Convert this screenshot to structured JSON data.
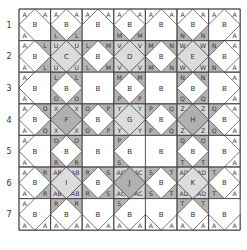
{
  "grid": {
    "x0": 19,
    "y0": 9,
    "cell": 31.6,
    "rows": 7,
    "cols": 7,
    "row_labels": [
      "1",
      "2",
      "3",
      "4",
      "5",
      "6",
      "7"
    ],
    "colors": {
      "line": "#555555",
      "border": "#444444",
      "corner_dark": "#b4b4b4",
      "corner_light": "#d6d6d6",
      "center_light": "#dcdcdc",
      "center_dark": "#b0b0b0",
      "white": "#ffffff"
    },
    "cells": [
      [
        {
          "c": "B",
          "tl": "A",
          "tr": "A",
          "bl": "A",
          "br": ""
        },
        {
          "c": "B",
          "tl": "A",
          "tr": "A",
          "bl": "L",
          "br": "L"
        },
        {
          "c": "B",
          "tl": "A",
          "tr": "A",
          "bl": "",
          "br": ""
        },
        {
          "c": "B",
          "tl": "A",
          "tr": "A",
          "bl": "M",
          "br": "M"
        },
        {
          "c": "B",
          "tl": "A",
          "tr": "A",
          "bl": "",
          "br": ""
        },
        {
          "c": "B",
          "tl": "A",
          "tr": "A",
          "bl": "N",
          "br": "N"
        },
        {
          "c": "B",
          "tl": "A",
          "tr": "A",
          "bl": "",
          "br": "A"
        }
      ],
      [
        {
          "c": "B",
          "tl": "A",
          "tr": "L",
          "bl": "A",
          "br": "L"
        },
        {
          "c": "C",
          "tl": "U",
          "tr": "U",
          "bl": "U",
          "br": "U",
          "shade": "light"
        },
        {
          "c": "B",
          "tl": "L",
          "tr": "M",
          "bl": "L",
          "br": "M"
        },
        {
          "c": "D",
          "tl": "V",
          "tr": "V",
          "bl": "V",
          "br": "V",
          "shade": "light"
        },
        {
          "c": "B",
          "tl": "M",
          "tr": "N",
          "bl": "M",
          "br": "N"
        },
        {
          "c": "E",
          "tl": "W",
          "tr": "W",
          "bl": "W",
          "br": "W",
          "shade": "light"
        },
        {
          "c": "B",
          "tl": "N",
          "tr": "A",
          "bl": "N",
          "br": "A"
        }
      ],
      [
        {
          "c": "B",
          "tl": "A",
          "tr": "",
          "bl": "A",
          "br": ""
        },
        {
          "c": "B",
          "tl": "L",
          "tr": "L",
          "bl": "O",
          "br": "O"
        },
        {
          "c": "B",
          "tl": "",
          "tr": "",
          "bl": "",
          "br": ""
        },
        {
          "c": "B",
          "tl": "M",
          "tr": "M",
          "bl": "P",
          "br": "P"
        },
        {
          "c": "B",
          "tl": "",
          "tr": "",
          "bl": "",
          "br": ""
        },
        {
          "c": "B",
          "tl": "N",
          "tr": "N",
          "bl": "Q",
          "br": "Q"
        },
        {
          "c": "B",
          "tl": "",
          "tr": "A",
          "bl": "",
          "br": "A"
        }
      ],
      [
        {
          "c": "B",
          "tl": "A",
          "tr": "O",
          "bl": "A",
          "br": "O"
        },
        {
          "c": "F",
          "tl": "X",
          "tr": "X",
          "bl": "X",
          "br": "X",
          "shade": "dark"
        },
        {
          "c": "B",
          "tl": "O",
          "tr": "P",
          "bl": "O",
          "br": "P"
        },
        {
          "c": "G",
          "tl": "Y",
          "tr": "Y",
          "bl": "Y",
          "br": "Y",
          "shade": "light"
        },
        {
          "c": "B",
          "tl": "P",
          "tr": "Q",
          "bl": "P",
          "br": "Q"
        },
        {
          "c": "H",
          "tl": "Z",
          "tr": "Z",
          "bl": "Z",
          "br": "Z",
          "shade": "dark"
        },
        {
          "c": "B",
          "tl": "Q",
          "tr": "A",
          "bl": "Q",
          "br": "A"
        }
      ],
      [
        {
          "c": "B",
          "tl": "A",
          "tr": "",
          "bl": "A",
          "br": ""
        },
        {
          "c": "B",
          "tl": "O",
          "tr": "O",
          "bl": "R",
          "br": "R"
        },
        {
          "c": "B",
          "tl": "",
          "tr": "",
          "bl": "",
          "br": ""
        },
        {
          "c": "B",
          "tl": "P",
          "tr": "",
          "bl": "S",
          "br": ""
        },
        {
          "c": "B",
          "tl": "",
          "tr": "",
          "bl": "",
          "br": ""
        },
        {
          "c": "B",
          "tl": "Q",
          "tr": "Q",
          "bl": "T",
          "br": "T"
        },
        {
          "c": "B",
          "tl": "",
          "tr": "A",
          "bl": "",
          "br": "A"
        }
      ],
      [
        {
          "c": "B",
          "tl": "A",
          "tr": "R",
          "bl": "A",
          "br": "R"
        },
        {
          "c": "I",
          "tl": "AB",
          "tr": "AB",
          "bl": "AB",
          "br": "AB",
          "shade": "light"
        },
        {
          "c": "B",
          "tl": "R",
          "tr": "S",
          "bl": "R",
          "br": "S"
        },
        {
          "c": "J",
          "tl": "AC",
          "tr": "AC",
          "bl": "AC",
          "br": "AC",
          "shade": "dark"
        },
        {
          "c": "B",
          "tl": "S",
          "tr": "T",
          "bl": "S",
          "br": "T"
        },
        {
          "c": "K",
          "tl": "AD",
          "tr": "AD",
          "bl": "AD",
          "br": "AD",
          "shade": "light"
        },
        {
          "c": "B",
          "tl": "T",
          "tr": "A",
          "bl": "T",
          "br": "A"
        }
      ],
      [
        {
          "c": "B",
          "tl": "A",
          "tr": "",
          "bl": "A",
          "br": "A"
        },
        {
          "c": "B",
          "tl": "R",
          "tr": "R",
          "bl": "A",
          "br": "A"
        },
        {
          "c": "B",
          "tl": "",
          "tr": "",
          "bl": "A",
          "br": "A"
        },
        {
          "c": "B",
          "tl": "S",
          "tr": "",
          "bl": "A",
          "br": "A"
        },
        {
          "c": "B",
          "tl": "",
          "tr": "",
          "bl": "A",
          "br": "A"
        },
        {
          "c": "B",
          "tl": "T",
          "tr": "T",
          "bl": "A",
          "br": "A"
        },
        {
          "c": "B",
          "tl": "",
          "tr": "",
          "bl": "A",
          "br": "A"
        }
      ]
    ],
    "dark_corner_labels": [
      "L",
      "M",
      "N",
      "O",
      "P",
      "Q",
      "R",
      "S",
      "T"
    ],
    "light_corner_labels": [
      "U",
      "V",
      "W",
      "X",
      "Y",
      "Z",
      "AB",
      "AC",
      "AD"
    ]
  }
}
